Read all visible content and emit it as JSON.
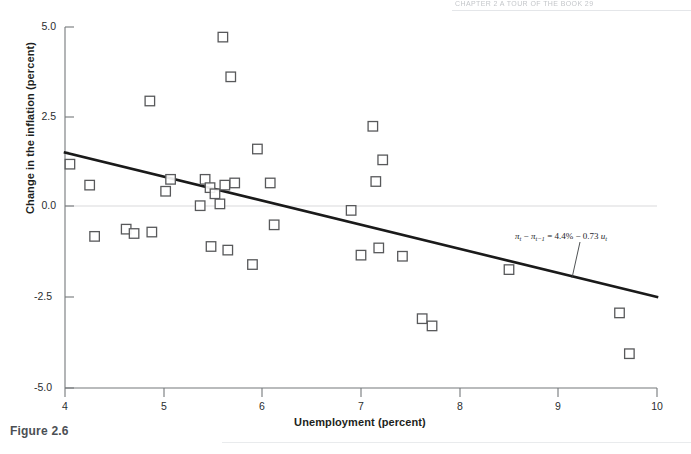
{
  "page": {
    "running_head": "CHAPTER 2  A TOUR OF THE BOOK   29",
    "figure_caption": "Figure 2.6"
  },
  "chart_data": {
    "type": "scatter",
    "title": "",
    "xlabel": "Unemployment (percent)",
    "ylabel": "Change in the inflation (percent)",
    "xlim": [
      4,
      10
    ],
    "ylim": [
      -5.0,
      5.0
    ],
    "xticks": [
      4,
      5,
      6,
      7,
      8,
      9,
      10
    ],
    "xtick_labels": [
      "4",
      "5",
      "6",
      "7",
      "8",
      "9",
      "10"
    ],
    "yticks": [
      5.0,
      2.5,
      0.0,
      -2.5,
      -5.0
    ],
    "ytick_labels": [
      "5.0",
      "2.5",
      "0.0",
      "-2.5",
      "-5.0"
    ],
    "grid": false,
    "zero_line": true,
    "legend": "none",
    "marker": "open-square",
    "marker_color": "#58595b",
    "points": [
      {
        "x": 4.05,
        "y": 1.2
      },
      {
        "x": 4.25,
        "y": 0.62
      },
      {
        "x": 4.3,
        "y": -0.8
      },
      {
        "x": 4.62,
        "y": -0.6
      },
      {
        "x": 4.7,
        "y": -0.72
      },
      {
        "x": 4.86,
        "y": 2.95
      },
      {
        "x": 4.88,
        "y": -0.68
      },
      {
        "x": 5.02,
        "y": 0.45
      },
      {
        "x": 5.07,
        "y": 0.78
      },
      {
        "x": 5.37,
        "y": 0.05
      },
      {
        "x": 5.42,
        "y": 0.78
      },
      {
        "x": 5.47,
        "y": 0.55
      },
      {
        "x": 5.52,
        "y": 0.38
      },
      {
        "x": 5.57,
        "y": 0.1
      },
      {
        "x": 5.6,
        "y": 4.72
      },
      {
        "x": 5.62,
        "y": 0.62
      },
      {
        "x": 5.65,
        "y": -1.18
      },
      {
        "x": 5.68,
        "y": 3.62
      },
      {
        "x": 5.72,
        "y": 0.68
      },
      {
        "x": 5.48,
        "y": -1.08
      },
      {
        "x": 5.9,
        "y": -1.58
      },
      {
        "x": 5.95,
        "y": 1.62
      },
      {
        "x": 6.08,
        "y": 0.68
      },
      {
        "x": 6.12,
        "y": -0.48
      },
      {
        "x": 6.9,
        "y": -0.08
      },
      {
        "x": 7.0,
        "y": -1.32
      },
      {
        "x": 7.12,
        "y": 2.25
      },
      {
        "x": 7.15,
        "y": 0.72
      },
      {
        "x": 7.18,
        "y": -1.12
      },
      {
        "x": 7.22,
        "y": 1.32
      },
      {
        "x": 7.42,
        "y": -1.35
      },
      {
        "x": 7.62,
        "y": -3.08
      },
      {
        "x": 7.72,
        "y": -3.28
      },
      {
        "x": 8.5,
        "y": -1.72
      },
      {
        "x": 9.62,
        "y": -2.92
      },
      {
        "x": 9.72,
        "y": -4.05
      }
    ],
    "regression_line": {
      "x_start": 4.0,
      "y_start": 1.48,
      "x_end": 10.0,
      "y_end": -2.52,
      "equation_parts": {
        "lhs_pi": "π",
        "lhs_sub1": "t",
        "minus": " − ",
        "lhs_sub2": "t−1",
        "eq": " = 4.4% − 0.73 ",
        "rhs_u": "u",
        "rhs_sub": "t"
      },
      "equation_text": "πt − πt−1 = 4.4% − 0.73 ut"
    }
  }
}
